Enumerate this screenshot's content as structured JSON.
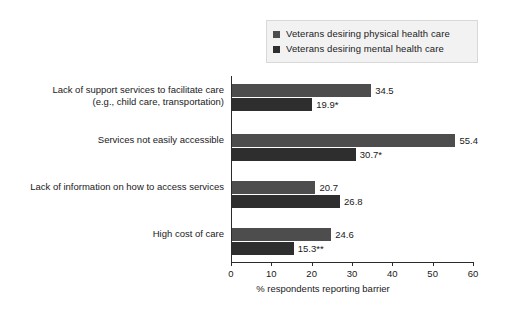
{
  "chart_data": {
    "type": "bar",
    "orientation": "horizontal",
    "title": "",
    "xlabel": "% respondents reporting barrier",
    "ylabel": "",
    "xlim": [
      0,
      60
    ],
    "xticks": [
      0,
      10,
      20,
      30,
      40,
      50,
      60
    ],
    "grid": false,
    "legend_position": "top-right",
    "categories": [
      "Lack of support services to facilitate care (e.g., child care, transportation)",
      "Services not easily accessible",
      "Lack of information on how to access services",
      "High cost of care"
    ],
    "category_lines": [
      [
        "Lack of support services to facilitate care",
        "(e.g., child care, transportation)"
      ],
      [
        "Services not easily accessible"
      ],
      [
        "Lack of information on how to access services"
      ],
      [
        "High cost of care"
      ]
    ],
    "series": [
      {
        "name": "Veterans desiring physical health care",
        "color": "#4d4d4d",
        "values": [
          34.5,
          55.4,
          20.7,
          24.6
        ],
        "labels": [
          "34.5",
          "55.4",
          "20.7",
          "24.6"
        ]
      },
      {
        "name": "Veterans desiring mental health care",
        "color": "#2e2e2e",
        "values": [
          19.9,
          30.7,
          26.8,
          15.3
        ],
        "labels": [
          "19.9*",
          "30.7*",
          "26.8",
          "15.3**"
        ]
      }
    ],
    "annotations": [
      "*",
      "**"
    ]
  },
  "legend": {
    "items": [
      {
        "label": "Veterans desiring physical health care",
        "color": "#4d4d4d"
      },
      {
        "label": "Veterans desiring mental health care",
        "color": "#2e2e2e"
      }
    ]
  },
  "axis": {
    "x_title": "% respondents reporting barrier",
    "tick_labels": [
      "0",
      "10",
      "20",
      "30",
      "40",
      "50",
      "60"
    ]
  }
}
